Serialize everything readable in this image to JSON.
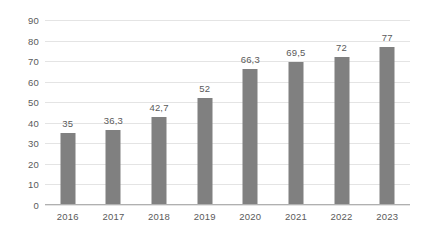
{
  "chart_data": {
    "type": "bar",
    "title": "",
    "subtitle": "",
    "xlabel": "",
    "ylabel": "",
    "categories": [
      "2016",
      "2017",
      "2018",
      "2019",
      "2020",
      "2021",
      "2022",
      "2023"
    ],
    "values": [
      35,
      36.3,
      42.7,
      52,
      66.3,
      69.5,
      72,
      77
    ],
    "value_labels": [
      "35",
      "36,3",
      "42,7",
      "52",
      "66,3",
      "69,5",
      "72",
      "77"
    ],
    "ylim": [
      0,
      90
    ],
    "ytick_step": 10,
    "yticks": [
      0,
      10,
      20,
      30,
      40,
      50,
      60,
      70,
      80,
      90
    ],
    "ytick_labels": [
      "0",
      "10",
      "20",
      "30",
      "40",
      "50",
      "60",
      "70",
      "80",
      "90"
    ],
    "grid": true,
    "grid_axis": "y",
    "legend": false,
    "legend_position": "none",
    "decimal_separator": ",",
    "colors": {
      "bar": "#808080",
      "gridline": "#e4e4e4",
      "axis": "#b0b0b0",
      "tick_text": "#5a5a5a",
      "value_text": "#5a5a5a",
      "background": "#ffffff"
    }
  }
}
